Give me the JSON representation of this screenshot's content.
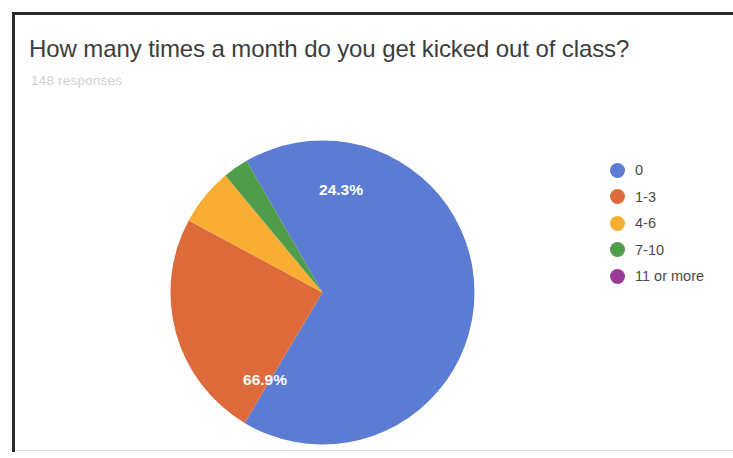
{
  "card": {
    "title": "How many times a month do you get kicked out of class?",
    "subtitle": "148 responses"
  },
  "legend": {
    "items": [
      {
        "label": "0",
        "color": "#5c7cd4"
      },
      {
        "label": "1-3",
        "color": "#dd6a3b"
      },
      {
        "label": "4-6",
        "color": "#f9ae33"
      },
      {
        "label": "7-10",
        "color": "#4f9d4b"
      },
      {
        "label": "11 or more",
        "color": "#9c3a97"
      }
    ]
  },
  "slice_labels": {
    "blue": "66.9%",
    "orange": "24.3%"
  },
  "chart_data": {
    "type": "pie",
    "title": "How many times a month do you get kicked out of class?",
    "subtitle": "148 responses",
    "total_responses": 148,
    "categories": [
      "0",
      "1-3",
      "4-6",
      "7-10",
      "11 or more"
    ],
    "values": [
      66.9,
      24.3,
      6.1,
      2.7,
      0.0
    ],
    "value_unit": "percent",
    "visible_data_labels": [
      "66.9%",
      "24.3%"
    ],
    "colors": [
      "#5c7cd4",
      "#dd6a3b",
      "#f9ae33",
      "#4f9d4b",
      "#9c3a97"
    ],
    "legend_position": "right",
    "grid": false,
    "start_angle_deg": -30,
    "direction": "clockwise"
  }
}
